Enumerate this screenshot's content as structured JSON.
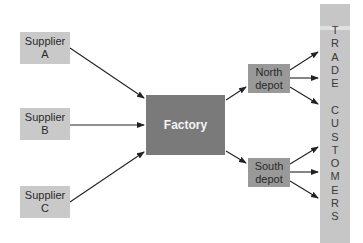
{
  "diagram": {
    "suppliers": [
      {
        "line1": "Supplier",
        "line2": "A"
      },
      {
        "line1": "Supplier",
        "line2": "B"
      },
      {
        "line1": "Supplier",
        "line2": "C"
      }
    ],
    "factory": {
      "label": "Factory"
    },
    "depots": [
      {
        "line1": "North",
        "line2": "depot"
      },
      {
        "line1": "South",
        "line2": "depot"
      }
    ],
    "trade_customers": {
      "word1": "TRADE",
      "word2": "CUSTOMERS"
    },
    "colors": {
      "supplier_fill": "#c9c9c9",
      "factory_fill": "#7a7a7a",
      "depot_fill": "#999999",
      "customer_bar_fill": "#c6c6c6",
      "arrow": "#222222"
    }
  }
}
